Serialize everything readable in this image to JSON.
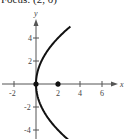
{
  "caption": "Focus: (2, 0)",
  "chart_data": {
    "type": "line",
    "title": "Focus: (2, 0)",
    "xlabel": "x",
    "ylabel": "y",
    "xlim": [
      -3,
      7
    ],
    "ylim": [
      -5,
      5.5
    ],
    "x_ticks": [
      -2,
      2,
      4,
      6
    ],
    "y_ticks": [
      -4,
      -2,
      2,
      4
    ],
    "grid": false,
    "series": [
      {
        "name": "parabola y^2 = 8x",
        "equation": "y^2 = 8x",
        "points": [
          {
            "x": 3.125,
            "y": 5
          },
          {
            "x": 2,
            "y": 4
          },
          {
            "x": 1.125,
            "y": 3
          },
          {
            "x": 0.5,
            "y": 2
          },
          {
            "x": 0.125,
            "y": 1
          },
          {
            "x": 0,
            "y": 0
          },
          {
            "x": 0.125,
            "y": -1
          },
          {
            "x": 0.5,
            "y": -2
          },
          {
            "x": 1.125,
            "y": -3
          },
          {
            "x": 2,
            "y": -4
          },
          {
            "x": 3.125,
            "y": -5
          }
        ]
      }
    ],
    "marked_points": [
      {
        "label": "vertex",
        "x": 0,
        "y": 0
      },
      {
        "label": "focus",
        "x": 2,
        "y": 0
      }
    ]
  },
  "labels": {
    "x_axis": "x",
    "y_axis": "y",
    "x_ticks": [
      "-2",
      "2",
      "4",
      "6"
    ],
    "y_ticks": [
      "4",
      "2",
      "-2",
      "-4"
    ]
  }
}
